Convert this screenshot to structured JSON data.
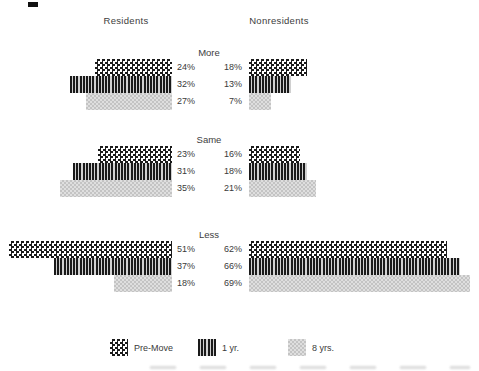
{
  "chart_data": {
    "type": "bar",
    "orientation": "horizontal",
    "unit": "%",
    "column_headers": [
      "Residents",
      "Nonresidents"
    ],
    "groups": [
      {
        "label": "More",
        "residents": [
          {
            "series": "Pre-Move",
            "value": 24,
            "label": "24%"
          },
          {
            "series": "1 yr.",
            "value": 32,
            "label": "32%"
          },
          {
            "series": "8 yrs.",
            "value": 27,
            "label": "27%"
          }
        ],
        "nonresidents": [
          {
            "series": "Pre-Move",
            "value": 18,
            "label": "18%"
          },
          {
            "series": "1 yr.",
            "value": 13,
            "label": "13%"
          },
          {
            "series": "8 yrs.",
            "value": 7,
            "label": "7%"
          }
        ]
      },
      {
        "label": "Same",
        "residents": [
          {
            "series": "Pre-Move",
            "value": 23,
            "label": "23%"
          },
          {
            "series": "1 yr.",
            "value": 31,
            "label": "31%"
          },
          {
            "series": "8 yrs.",
            "value": 35,
            "label": "35%"
          }
        ],
        "nonresidents": [
          {
            "series": "Pre-Move",
            "value": 16,
            "label": "16%"
          },
          {
            "series": "1 yr.",
            "value": 18,
            "label": "18%"
          },
          {
            "series": "8 yrs.",
            "value": 21,
            "label": "21%"
          }
        ]
      },
      {
        "label": "Less",
        "residents": [
          {
            "series": "Pre-Move",
            "value": 51,
            "label": "51%"
          },
          {
            "series": "1 yr.",
            "value": 37,
            "label": "37%"
          },
          {
            "series": "8 yrs.",
            "value": 18,
            "label": "18%"
          }
        ],
        "nonresidents": [
          {
            "series": "Pre-Move",
            "value": 62,
            "label": "62%"
          },
          {
            "series": "1 yr.",
            "value": 66,
            "label": "66%"
          },
          {
            "series": "8 yrs.",
            "value": 69,
            "label": "69%"
          }
        ]
      }
    ],
    "legend": [
      {
        "label": "Pre-Move",
        "pattern": "dark-checker"
      },
      {
        "label": "1 yr.",
        "pattern": "vertical-stripes"
      },
      {
        "label": "8 yrs.",
        "pattern": "light-checker"
      }
    ],
    "layout_hints": {
      "legend_position": "bottom",
      "grid": "off",
      "residents_bars": "right-aligned",
      "nonresidents_bars": "left-aligned"
    },
    "colors": {
      "pattern_dark": "#1a1a1a",
      "pattern_light_gray": "#c4c4c4",
      "text": "#3a3a3a",
      "background": "#ffffff"
    }
  }
}
